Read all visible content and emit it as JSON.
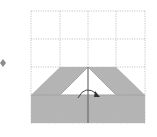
{
  "diagram": {
    "type": "origami-fold-step",
    "grid": {
      "rows": 4,
      "cols": 4,
      "x0": 31,
      "y0": 11,
      "cell": 28.5,
      "line_color": "#b8b8b8"
    },
    "paper_color": "#b4b4b4",
    "paper_edge_color": "#9a9a9a",
    "step_marker_color": "#8c8c8c",
    "fold_line_color": "#6e6e6e",
    "arrow_color": "#333333",
    "arrow_direction": "rotate-clockwise-over-center-line"
  }
}
